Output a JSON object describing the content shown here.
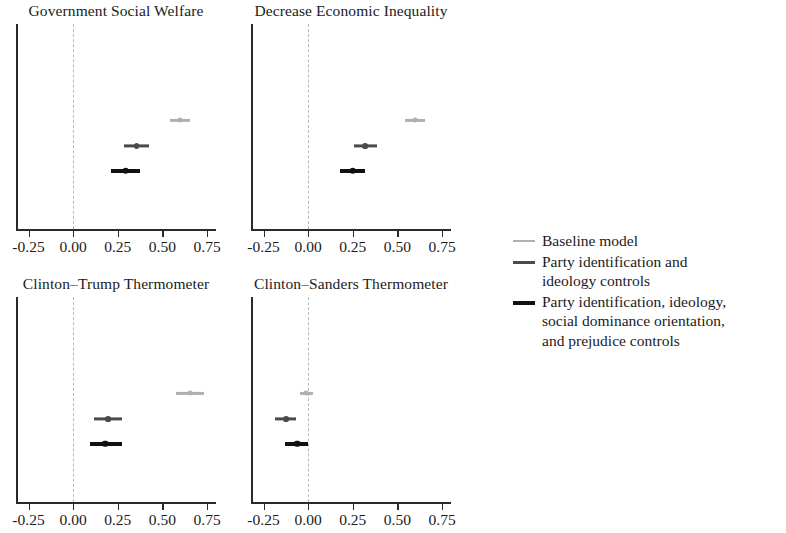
{
  "figure": {
    "background": "#ffffff",
    "axis_color": "#2a2a2a",
    "zero_line_color": "#b9b9b9"
  },
  "legend": {
    "position": "right",
    "entries": [
      {
        "label": "Baseline model",
        "color": "#b0b0b0",
        "thickness": 2.2
      },
      {
        "label": "Party identification and\nideology controls",
        "color": "#4a4a4a",
        "thickness": 3.2
      },
      {
        "label": "Party identification, ideology,\nsocial dominance orientation,\nand prejudice controls",
        "color": "#111111",
        "thickness": 4.0
      }
    ]
  },
  "axis": {
    "tick_labels": [
      "-0.25",
      "0.00",
      "0.25",
      "0.50",
      "0.75"
    ],
    "tick_values": [
      -0.25,
      0.0,
      0.25,
      0.5,
      0.75
    ],
    "xlim": [
      -0.32,
      0.8
    ],
    "zero_value": 0.0
  },
  "chart_data": {
    "type": "scatter",
    "title": "",
    "subtitle": "",
    "xlabel": "",
    "ylabel": "",
    "grid": false,
    "legend_position": "right",
    "xlim": [
      -0.32,
      0.8
    ],
    "xticks": [
      -0.25,
      0.0,
      0.25,
      0.5,
      0.75
    ],
    "xticklabels": [
      "-0.25",
      "0.00",
      "0.25",
      "0.50",
      "0.75"
    ],
    "zero_reference_line": 0.0,
    "series": [
      {
        "name": "Baseline model",
        "color": "#b0b0b0"
      },
      {
        "name": "Party identification and ideology controls",
        "color": "#4a4a4a"
      },
      {
        "name": "Party identification, ideology, social dominance orientation, and prejudice controls",
        "color": "#111111"
      }
    ],
    "panels": [
      {
        "title": "Government Social Welfare",
        "points": [
          {
            "series": "Baseline model",
            "estimate": 0.6,
            "ci_low": 0.545,
            "ci_high": 0.655
          },
          {
            "series": "Party identification and ideology controls",
            "estimate": 0.355,
            "ci_low": 0.285,
            "ci_high": 0.425
          },
          {
            "series": "Party identification, ideology, social dominance orientation, and prejudice controls",
            "estimate": 0.295,
            "ci_low": 0.21,
            "ci_high": 0.375
          }
        ]
      },
      {
        "title": "Decrease Economic Inequality",
        "points": [
          {
            "series": "Baseline model",
            "estimate": 0.6,
            "ci_low": 0.545,
            "ci_high": 0.655
          },
          {
            "series": "Party identification and ideology controls",
            "estimate": 0.32,
            "ci_low": 0.255,
            "ci_high": 0.385
          },
          {
            "series": "Party identification, ideology, social dominance orientation, and prejudice controls",
            "estimate": 0.25,
            "ci_low": 0.18,
            "ci_high": 0.32
          }
        ]
      },
      {
        "title": "Clinton–Trump Thermometer",
        "points": [
          {
            "series": "Baseline model",
            "estimate": 0.655,
            "ci_low": 0.575,
            "ci_high": 0.735
          },
          {
            "series": "Party identification and ideology controls",
            "estimate": 0.195,
            "ci_low": 0.115,
            "ci_high": 0.275
          },
          {
            "series": "Party identification, ideology, social dominance orientation, and prejudice controls",
            "estimate": 0.18,
            "ci_low": 0.095,
            "ci_high": 0.275
          }
        ]
      },
      {
        "title": "Clinton–Sanders Thermometer",
        "points": [
          {
            "series": "Baseline model",
            "estimate": -0.01,
            "ci_low": -0.045,
            "ci_high": 0.03
          },
          {
            "series": "Party identification and ideology controls",
            "estimate": -0.125,
            "ci_low": -0.185,
            "ci_high": -0.07
          },
          {
            "series": "Party identification, ideology, social dominance orientation, and prejudice controls",
            "estimate": -0.06,
            "ci_low": -0.13,
            "ci_high": 0.0
          }
        ]
      }
    ]
  }
}
